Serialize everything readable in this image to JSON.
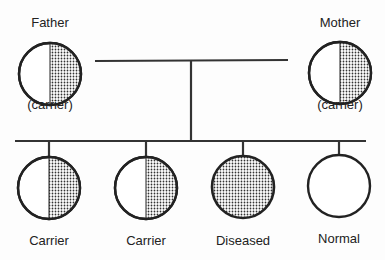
{
  "legend_note": "Stippled half = carrier; fully stippled = diseased; unshaded = normal",
  "parents": [
    {
      "role": "Father",
      "status": "(carrier)",
      "shading": "half"
    },
    {
      "role": "Mother",
      "status": "(carrier)",
      "shading": "half"
    }
  ],
  "children": [
    {
      "label": "Carrier",
      "shading": "half"
    },
    {
      "label": "Carrier",
      "shading": "half"
    },
    {
      "label": "Diseased",
      "shading": "full"
    },
    {
      "label": "Normal",
      "shading": "none"
    }
  ],
  "colors": {
    "line": "#333333",
    "dots": "#333333",
    "background": "#fdfdfd"
  }
}
